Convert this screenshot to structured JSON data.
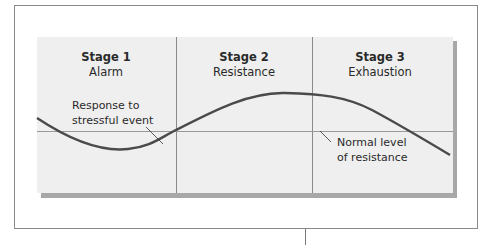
{
  "diagram": {
    "stages": [
      {
        "title": "Stage 1",
        "name": "Alarm"
      },
      {
        "title": "Stage 2",
        "name": "Resistance"
      },
      {
        "title": "Stage 3",
        "name": "Exhaustion"
      }
    ],
    "annotations": {
      "response": {
        "line1": "Response to",
        "line2": "stressful event"
      },
      "normal": {
        "line1": "Normal level",
        "line2": "of resistance"
      }
    },
    "colors": {
      "panel": "#efefef",
      "curve": "#4a4a4a",
      "baseline": "#9a9a9a",
      "divider": "#8a8a8a",
      "shadow": "#a8a8a8"
    }
  }
}
